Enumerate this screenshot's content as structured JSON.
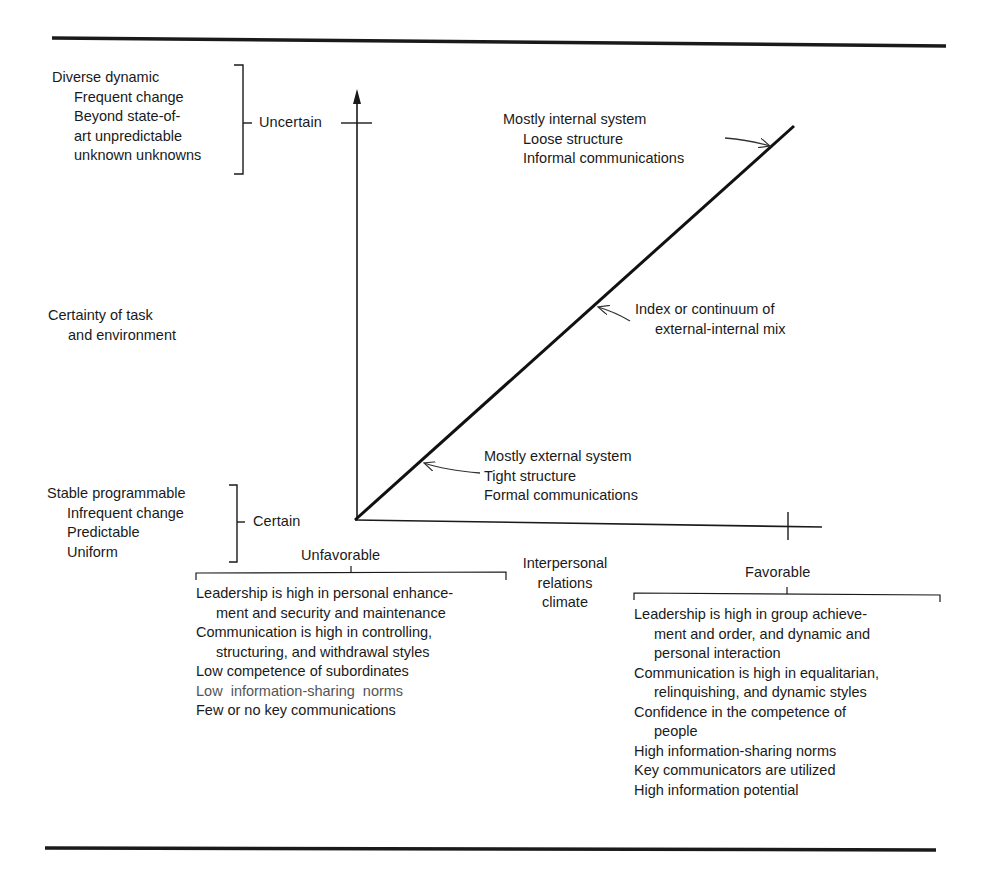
{
  "figure": {
    "vertical_axis": {
      "label_line1": "Certainty of task",
      "label_line2": "and environment",
      "top_tick_label": "Uncertain",
      "bottom_tick_label": "Certain",
      "uncertain_descriptors": [
        "Diverse dynamic",
        "Frequent change",
        "Beyond state-of-",
        "art unpredictable",
        "unknown unknowns"
      ],
      "certain_descriptors": [
        "Stable programmable",
        "Infrequent change",
        "Predictable",
        "Uniform"
      ]
    },
    "horizontal_axis": {
      "label_line1": "Interpersonal",
      "label_line2": "relations",
      "label_line3": "climate",
      "left_label": "Unfavorable",
      "right_label": "Favorable"
    },
    "diagonal": {
      "top_annotation": [
        "Mostly internal system",
        "Loose structure",
        "Informal communications"
      ],
      "middle_annotation": [
        "Index or continuum of",
        "external-internal mix"
      ],
      "bottom_annotation": [
        "Mostly external system",
        "Tight structure",
        "Formal communications"
      ]
    },
    "unfavorable_characteristics": [
      "Leadership is high in personal enhance-",
      "ment and security and maintenance",
      "Communication is high in controlling,",
      "structuring, and withdrawal styles",
      "Low competence of subordinates",
      "Low  information-sharing  norms",
      "Few or no key communications"
    ],
    "favorable_characteristics": [
      "Leadership is high in group achieve-",
      "ment and order, and dynamic and",
      "personal interaction",
      "Communication is high in equalitarian,",
      "relinquishing, and dynamic styles",
      "Confidence in the competence of",
      "people",
      "High information-sharing norms",
      "Key communicators are utilized",
      "High information potential"
    ]
  },
  "colors": {
    "ink": "#1a1a1a",
    "background": "#ffffff"
  }
}
